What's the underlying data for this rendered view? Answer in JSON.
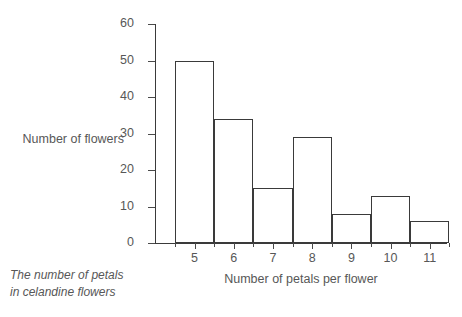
{
  "chart_data": {
    "type": "bar",
    "title": "",
    "categories": [
      "5",
      "6",
      "7",
      "8",
      "9",
      "10",
      "11"
    ],
    "values": [
      50,
      34,
      15,
      29,
      8,
      13,
      6
    ],
    "xlabel": "Number of petals per flower",
    "ylabel": "Number of flowers",
    "ylim": [
      0,
      60
    ],
    "yticks": [
      0,
      10,
      20,
      30,
      40,
      50,
      60
    ],
    "ytick_labels": [
      "0",
      "10",
      "20",
      "30",
      "40",
      "50",
      "60"
    ],
    "grid": false,
    "legend": false,
    "caption_line1": "The number of petals",
    "caption_line2": "in celandine flowers",
    "bar_edge_color": "#3a3a3a",
    "bar_fill_color": "#ffffff",
    "axis_color": "#3a3a3a",
    "text_color": "#575757",
    "background_color": "#ffffff"
  }
}
